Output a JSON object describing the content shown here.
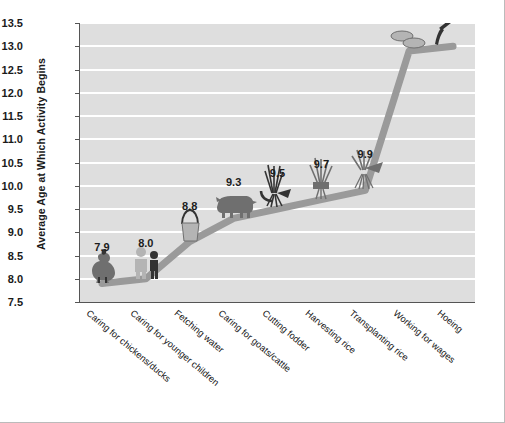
{
  "chart_data": {
    "type": "line",
    "title": "",
    "xlabel": "",
    "ylabel": "Average Age at Which Activity Begins",
    "ylim": [
      7.5,
      13.5
    ],
    "ytick_step": 0.5,
    "grid": true,
    "legend": "none",
    "yticks": [
      "13.5",
      "13.0",
      "12.5",
      "12.0",
      "11.5",
      "11.0",
      "10.5",
      "10.0",
      "9.5",
      "9.0",
      "8.5",
      "8.0",
      "7.5"
    ],
    "categories": [
      "Caring for chickens/ducks",
      "Caring for younger children",
      "Fetching water",
      "Caring for goats/cattle",
      "Cutting fodder",
      "Harvesting rice",
      "Transplanting rice",
      "Working for wages",
      "Hoeing"
    ],
    "values": [
      7.9,
      8.0,
      8.8,
      9.3,
      9.5,
      9.7,
      9.9,
      12.9,
      13.0
    ],
    "value_labels": [
      "7.9",
      "8.0",
      "8.8",
      "9.3",
      "9.5",
      "9.7",
      "9.9",
      "12.9",
      "13.0"
    ],
    "icons": [
      "rooster-icon",
      "children-icon",
      "water-bucket-icon",
      "cattle-icon",
      "fodder-sickle-icon",
      "rice-bundle-icon",
      "rice-seedling-icon",
      "coins-wages-icon",
      "hoe-icon"
    ]
  },
  "colors": {
    "plot_background": "#dedede",
    "gridline": "#ffffff",
    "series_line": "#9a9a9a",
    "axis": "#555555",
    "text": "#1a1a1a",
    "icon_dark": "#333333",
    "icon_mid": "#6f6f6f",
    "icon_light": "#b4b4b4"
  }
}
